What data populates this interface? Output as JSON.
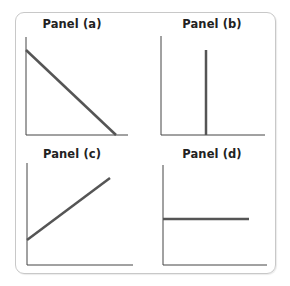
{
  "figure": {
    "panels": [
      {
        "id": "a",
        "title": "Panel (a)",
        "shape": "downward-sloping line"
      },
      {
        "id": "b",
        "title": "Panel (b)",
        "shape": "vertical line"
      },
      {
        "id": "c",
        "title": "Panel (c)",
        "shape": "upward-sloping line"
      },
      {
        "id": "d",
        "title": "Panel (d)",
        "shape": "horizontal line"
      }
    ],
    "colors": {
      "curve": "#555555",
      "axis": "#444444",
      "border": "#c8c8c8"
    }
  }
}
